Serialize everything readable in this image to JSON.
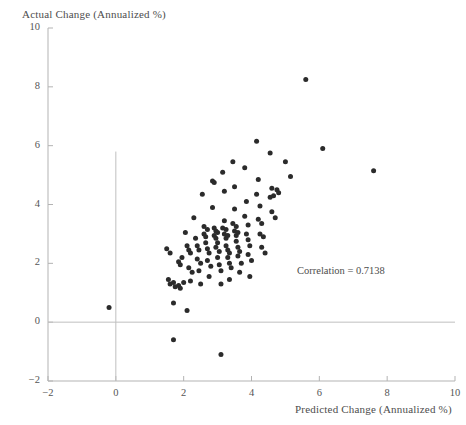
{
  "chart_data": {
    "type": "scatter",
    "title": "",
    "xlabel": "Predicted Change (Annualized %)",
    "ylabel": "Actual Change (Annualized %)",
    "xlim": [
      -2,
      10
    ],
    "ylim": [
      -2,
      10
    ],
    "xticks": [
      "-2",
      "0",
      "2",
      "4",
      "6",
      "8",
      "10"
    ],
    "xtick_values": [
      -2,
      0,
      2,
      4,
      6,
      8,
      10
    ],
    "yticks": [
      "10",
      "8",
      "6",
      "4",
      "2",
      "0",
      "-2"
    ],
    "ytick_values": [
      10,
      8,
      6,
      4,
      2,
      0,
      -2
    ],
    "grid": false,
    "legend": null,
    "annotations": [
      {
        "text": "Correlation = 0.7138",
        "x": 6.1,
        "y": 1.55
      }
    ],
    "reference_lines": [
      {
        "name": "horizontal-zero-line",
        "orientation": "horizontal",
        "value": 0,
        "color": "#bfbfbf"
      },
      {
        "name": "vertical-zero-line",
        "orientation": "vertical",
        "value": 0,
        "color": "#bfbfbf"
      }
    ],
    "marker": {
      "shape": "circle",
      "color": "#2b2b2b",
      "size": 5
    },
    "series": [
      {
        "name": "observations",
        "points": [
          [
            -0.2,
            0.5
          ],
          [
            1.5,
            2.5
          ],
          [
            1.6,
            2.35
          ],
          [
            1.55,
            1.45
          ],
          [
            1.6,
            1.3
          ],
          [
            1.7,
            1.35
          ],
          [
            1.75,
            1.2
          ],
          [
            1.7,
            0.65
          ],
          [
            1.7,
            -0.6
          ],
          [
            1.85,
            2.05
          ],
          [
            1.9,
            1.95
          ],
          [
            1.95,
            2.2
          ],
          [
            1.85,
            1.25
          ],
          [
            1.9,
            1.15
          ],
          [
            2.0,
            1.35
          ],
          [
            2.05,
            3.05
          ],
          [
            2.1,
            2.6
          ],
          [
            2.15,
            2.45
          ],
          [
            2.2,
            2.35
          ],
          [
            2.15,
            1.85
          ],
          [
            2.25,
            1.7
          ],
          [
            2.2,
            1.4
          ],
          [
            2.1,
            0.4
          ],
          [
            2.3,
            3.55
          ],
          [
            2.35,
            2.85
          ],
          [
            2.4,
            2.6
          ],
          [
            2.45,
            2.45
          ],
          [
            2.4,
            2.15
          ],
          [
            2.5,
            2.0
          ],
          [
            2.45,
            1.75
          ],
          [
            2.5,
            1.3
          ],
          [
            2.55,
            4.35
          ],
          [
            2.6,
            3.25
          ],
          [
            2.6,
            3.0
          ],
          [
            2.65,
            2.9
          ],
          [
            2.7,
            3.15
          ],
          [
            2.65,
            2.7
          ],
          [
            2.7,
            2.5
          ],
          [
            2.75,
            2.35
          ],
          [
            2.7,
            2.1
          ],
          [
            2.8,
            1.9
          ],
          [
            2.75,
            1.55
          ],
          [
            2.85,
            4.8
          ],
          [
            2.9,
            4.75
          ],
          [
            2.85,
            3.9
          ],
          [
            2.9,
            3.2
          ],
          [
            2.95,
            3.1
          ],
          [
            2.9,
            2.95
          ],
          [
            3.0,
            3.05
          ],
          [
            2.95,
            2.85
          ],
          [
            3.0,
            2.7
          ],
          [
            2.95,
            2.55
          ],
          [
            3.05,
            2.4
          ],
          [
            3.0,
            2.2
          ],
          [
            3.05,
            1.95
          ],
          [
            3.1,
            1.75
          ],
          [
            3.1,
            1.3
          ],
          [
            3.1,
            -1.1
          ],
          [
            3.15,
            5.1
          ],
          [
            3.2,
            4.45
          ],
          [
            3.2,
            3.45
          ],
          [
            3.15,
            3.2
          ],
          [
            3.25,
            3.15
          ],
          [
            3.2,
            3.0
          ],
          [
            3.25,
            2.85
          ],
          [
            3.3,
            2.95
          ],
          [
            3.25,
            2.6
          ],
          [
            3.3,
            2.45
          ],
          [
            3.35,
            2.35
          ],
          [
            3.3,
            2.2
          ],
          [
            3.35,
            2.0
          ],
          [
            3.4,
            1.85
          ],
          [
            3.35,
            1.45
          ],
          [
            3.45,
            5.45
          ],
          [
            3.5,
            4.6
          ],
          [
            3.5,
            3.85
          ],
          [
            3.45,
            3.35
          ],
          [
            3.55,
            3.25
          ],
          [
            3.5,
            3.1
          ],
          [
            3.55,
            2.95
          ],
          [
            3.6,
            3.05
          ],
          [
            3.55,
            2.75
          ],
          [
            3.6,
            2.55
          ],
          [
            3.65,
            2.4
          ],
          [
            3.6,
            2.25
          ],
          [
            3.7,
            2.0
          ],
          [
            3.65,
            1.7
          ],
          [
            3.8,
            5.25
          ],
          [
            3.85,
            4.1
          ],
          [
            3.8,
            3.6
          ],
          [
            3.9,
            3.3
          ],
          [
            3.85,
            3.0
          ],
          [
            3.9,
            2.8
          ],
          [
            3.95,
            2.6
          ],
          [
            3.9,
            2.3
          ],
          [
            4.0,
            2.1
          ],
          [
            3.95,
            1.55
          ],
          [
            4.15,
            6.15
          ],
          [
            4.2,
            4.85
          ],
          [
            4.15,
            4.35
          ],
          [
            4.25,
            3.95
          ],
          [
            4.2,
            3.5
          ],
          [
            4.3,
            3.35
          ],
          [
            4.25,
            3.0
          ],
          [
            4.35,
            2.9
          ],
          [
            4.3,
            2.55
          ],
          [
            4.4,
            2.35
          ],
          [
            4.55,
            5.75
          ],
          [
            4.6,
            4.55
          ],
          [
            4.55,
            4.25
          ],
          [
            4.65,
            4.3
          ],
          [
            4.6,
            3.75
          ],
          [
            4.7,
            3.55
          ],
          [
            4.75,
            4.5
          ],
          [
            4.8,
            4.4
          ],
          [
            5.0,
            5.45
          ],
          [
            5.15,
            4.95
          ],
          [
            5.6,
            8.25
          ],
          [
            6.1,
            5.9
          ],
          [
            7.6,
            5.15
          ]
        ]
      }
    ]
  },
  "axes": {
    "spine_color": "#b3b3b3",
    "tick_color": "#b3b3b3"
  }
}
